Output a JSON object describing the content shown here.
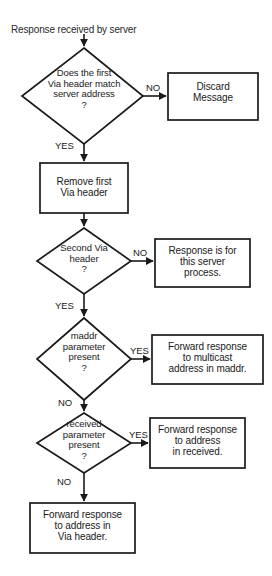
{
  "diagram": {
    "type": "flowchart",
    "title": "Response received by server",
    "background_color": "#ffffff",
    "stroke_color": "#1a1a1a",
    "text_color": "#1a1a1a",
    "nodes": [
      {
        "id": "start",
        "shape": "label",
        "text": "Response received by server"
      },
      {
        "id": "d1",
        "shape": "diamond",
        "text": "Does the first\nVia header match\nserver address\n?"
      },
      {
        "id": "b1",
        "shape": "rect",
        "text": "Discard\nMessage"
      },
      {
        "id": "b2",
        "shape": "rect",
        "text": "Remove first\nVia header"
      },
      {
        "id": "d2",
        "shape": "diamond",
        "text": "Second Via\nheader\n?"
      },
      {
        "id": "b3",
        "shape": "rect",
        "text": "Response is for\nthis server\nprocess."
      },
      {
        "id": "d3",
        "shape": "diamond",
        "text": "maddr\nparameter\npresent\n?"
      },
      {
        "id": "b4",
        "shape": "rect",
        "text": "Forward response\nto multicast\naddress in maddr."
      },
      {
        "id": "d4",
        "shape": "diamond",
        "text": "received\nparameter\npresent\n?"
      },
      {
        "id": "b5",
        "shape": "rect",
        "text": "Forward response\nto address\nin received."
      },
      {
        "id": "b6",
        "shape": "rect",
        "text": "Forward response\nto address in\nVia header."
      }
    ],
    "edge_labels": {
      "d1_no": "NO",
      "d1_yes": "YES",
      "d2_no": "NO",
      "d2_yes": "YES",
      "d3_yes": "YES",
      "d3_no": "NO",
      "d4_yes": "YES",
      "d4_no": "NO"
    }
  }
}
